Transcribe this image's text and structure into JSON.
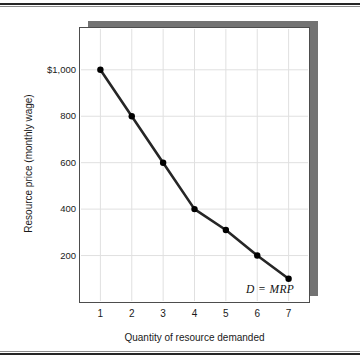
{
  "figure": {
    "background_color": "#ffffff",
    "panel_border_color": "#4d4d4d",
    "panel_shadow_color": "#737373",
    "rule_color": "#262626"
  },
  "curve_annotation": "D = MRP",
  "chart_data": {
    "type": "line",
    "title": "",
    "subtitle": "",
    "xlabel": "Quantity of resource demanded",
    "ylabel": "Resource price (monthly wage)",
    "x": [
      1,
      2,
      3,
      4,
      5,
      6,
      7
    ],
    "values": [
      1000,
      800,
      600,
      400,
      310,
      200,
      100
    ],
    "series": [
      {
        "name": "D = MRP",
        "values": [
          1000,
          800,
          600,
          400,
          310,
          200,
          100
        ],
        "color": "#262626",
        "marker": "circle",
        "marker_color": "#000000"
      }
    ],
    "xtick_labels": [
      "1",
      "2",
      "3",
      "4",
      "5",
      "6",
      "7"
    ],
    "ytick_labels": [
      "$1,000",
      "800",
      "600",
      "400",
      "200"
    ],
    "ytick_values": [
      1000,
      800,
      600,
      400,
      200
    ],
    "xlim": [
      0.35,
      7.65
    ],
    "ylim": [
      0,
      1180
    ],
    "grid": true,
    "grid_color": "#e0e0e0",
    "legend": "none",
    "annotations": [
      {
        "text": "D = MRP",
        "x": 6.5,
        "y": 55
      }
    ]
  }
}
